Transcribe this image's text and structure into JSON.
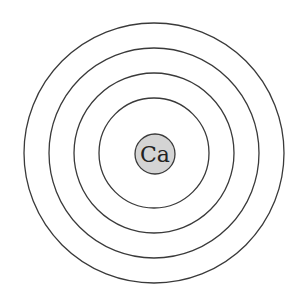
{
  "diagram": {
    "type": "bohr-model",
    "element_symbol": "Ca",
    "shell_count": 4,
    "colors": {
      "background": "#ffffff",
      "ring_stroke": "#3a3a3a",
      "nucleus_fill": "#d4d4d4",
      "nucleus_stroke": "#3a3a3a",
      "text": "#222222"
    }
  }
}
